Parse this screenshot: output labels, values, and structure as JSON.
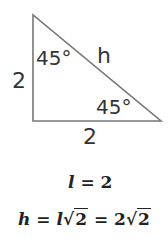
{
  "diagram": {
    "type": "right-triangle",
    "vertices": {
      "top": [
        33,
        15
      ],
      "bottom_left": [
        33,
        121
      ],
      "bottom_right": [
        161,
        121
      ]
    },
    "stroke_color": "#777777",
    "labels": {
      "left_side": "2",
      "bottom_side": "2",
      "hypotenuse": "h",
      "top_angle": "45°",
      "right_angle_at_vertex": "45°"
    }
  },
  "equations": {
    "line1": {
      "lhs": "l",
      "eq": "=",
      "rhs": "2"
    },
    "line2": {
      "lhs": "h",
      "eq1": "=",
      "term": "l",
      "sqrt_sym": "√",
      "rad1": "2",
      "eq2": "=",
      "coef": "2",
      "rad2": "2"
    }
  }
}
